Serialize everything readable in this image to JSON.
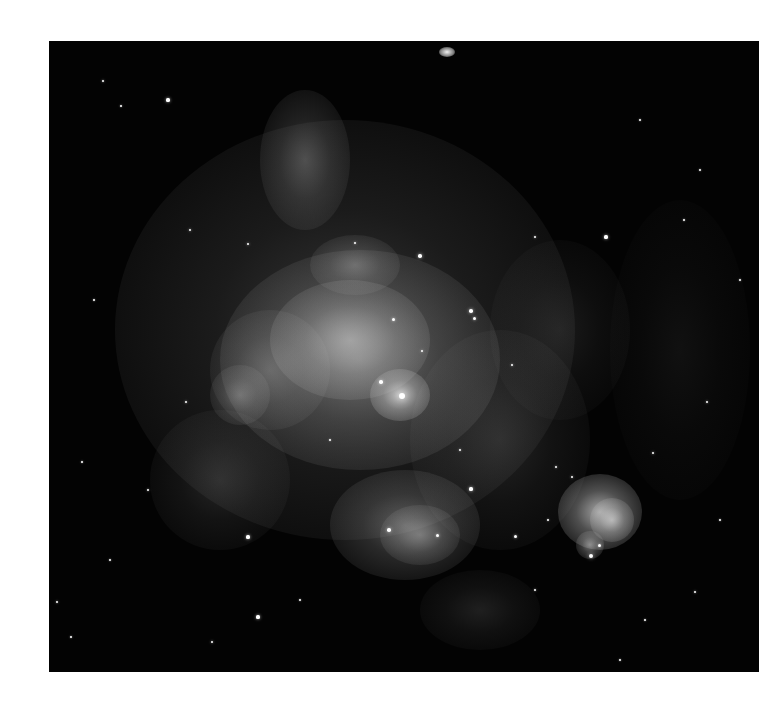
{
  "image": {
    "alt": "Grayscale astronomical image of a large emission nebula with filamentary gas and scattered stars",
    "background": "#030303",
    "page_background": "#ffffff"
  },
  "nebula": [
    {
      "x": 345,
      "y": 330,
      "rx": 230,
      "ry": 210,
      "a": 0.22
    },
    {
      "x": 360,
      "y": 360,
      "rx": 140,
      "ry": 110,
      "a": 0.35
    },
    {
      "x": 350,
      "y": 340,
      "rx": 80,
      "ry": 60,
      "a": 0.45
    },
    {
      "x": 400,
      "y": 395,
      "rx": 30,
      "ry": 26,
      "a": 0.75
    },
    {
      "x": 270,
      "y": 370,
      "rx": 60,
      "ry": 60,
      "a": 0.25
    },
    {
      "x": 240,
      "y": 395,
      "rx": 30,
      "ry": 30,
      "a": 0.3
    },
    {
      "x": 305,
      "y": 160,
      "rx": 45,
      "ry": 70,
      "a": 0.28
    },
    {
      "x": 355,
      "y": 265,
      "rx": 45,
      "ry": 30,
      "a": 0.3
    },
    {
      "x": 405,
      "y": 525,
      "rx": 75,
      "ry": 55,
      "a": 0.35
    },
    {
      "x": 420,
      "y": 535,
      "rx": 40,
      "ry": 30,
      "a": 0.35
    },
    {
      "x": 600,
      "y": 512,
      "rx": 42,
      "ry": 38,
      "a": 0.7
    },
    {
      "x": 612,
      "y": 520,
      "rx": 22,
      "ry": 22,
      "a": 0.6
    },
    {
      "x": 590,
      "y": 545,
      "rx": 14,
      "ry": 14,
      "a": 0.5
    },
    {
      "x": 220,
      "y": 480,
      "rx": 70,
      "ry": 70,
      "a": 0.15
    },
    {
      "x": 500,
      "y": 440,
      "rx": 90,
      "ry": 110,
      "a": 0.14
    },
    {
      "x": 560,
      "y": 330,
      "rx": 70,
      "ry": 90,
      "a": 0.1
    },
    {
      "x": 680,
      "y": 350,
      "rx": 70,
      "ry": 150,
      "a": 0.06
    },
    {
      "x": 480,
      "y": 610,
      "rx": 60,
      "ry": 40,
      "a": 0.12
    }
  ],
  "galaxy": {
    "x": 447,
    "y": 52,
    "rx": 8,
    "ry": 5,
    "a": 0.95
  },
  "stars": [
    {
      "x": 103,
      "y": 81,
      "r": 1.2
    },
    {
      "x": 121,
      "y": 106,
      "r": 1.0
    },
    {
      "x": 168,
      "y": 100,
      "r": 1.6
    },
    {
      "x": 402,
      "y": 396,
      "r": 3.0
    },
    {
      "x": 381,
      "y": 382,
      "r": 1.8
    },
    {
      "x": 393,
      "y": 319,
      "r": 1.5
    },
    {
      "x": 471,
      "y": 311,
      "r": 1.8
    },
    {
      "x": 474,
      "y": 318,
      "r": 1.5
    },
    {
      "x": 422,
      "y": 351,
      "r": 1.4
    },
    {
      "x": 248,
      "y": 244,
      "r": 1.4
    },
    {
      "x": 355,
      "y": 243,
      "r": 1.2
    },
    {
      "x": 420,
      "y": 256,
      "r": 1.8
    },
    {
      "x": 606,
      "y": 237,
      "r": 1.6
    },
    {
      "x": 591,
      "y": 556,
      "r": 2.2
    },
    {
      "x": 599,
      "y": 545,
      "r": 1.5
    },
    {
      "x": 556,
      "y": 467,
      "r": 1.3
    },
    {
      "x": 572,
      "y": 477,
      "r": 1.4
    },
    {
      "x": 653,
      "y": 453,
      "r": 1.4
    },
    {
      "x": 389,
      "y": 530,
      "r": 1.8
    },
    {
      "x": 437,
      "y": 535,
      "r": 1.5
    },
    {
      "x": 471,
      "y": 489,
      "r": 1.6
    },
    {
      "x": 186,
      "y": 402,
      "r": 1.2
    },
    {
      "x": 148,
      "y": 490,
      "r": 1.2
    },
    {
      "x": 248,
      "y": 537,
      "r": 1.6
    },
    {
      "x": 258,
      "y": 617,
      "r": 1.6
    },
    {
      "x": 212,
      "y": 642,
      "r": 1.4
    },
    {
      "x": 535,
      "y": 590,
      "r": 1.2
    },
    {
      "x": 707,
      "y": 402,
      "r": 1.3
    },
    {
      "x": 695,
      "y": 592,
      "r": 1.2
    },
    {
      "x": 645,
      "y": 620,
      "r": 1.0
    },
    {
      "x": 71,
      "y": 637,
      "r": 1.0
    },
    {
      "x": 57,
      "y": 602,
      "r": 1.2
    },
    {
      "x": 82,
      "y": 462,
      "r": 1.0
    },
    {
      "x": 535,
      "y": 237,
      "r": 1.2
    },
    {
      "x": 640,
      "y": 120,
      "r": 1.0
    },
    {
      "x": 700,
      "y": 170,
      "r": 1.0
    },
    {
      "x": 190,
      "y": 230,
      "r": 1.4
    },
    {
      "x": 94,
      "y": 300,
      "r": 1.0
    },
    {
      "x": 512,
      "y": 365,
      "r": 1.3
    },
    {
      "x": 460,
      "y": 450,
      "r": 1.2
    },
    {
      "x": 330,
      "y": 440,
      "r": 1.0
    },
    {
      "x": 548,
      "y": 520,
      "r": 1.0
    },
    {
      "x": 684,
      "y": 220,
      "r": 1.0
    },
    {
      "x": 740,
      "y": 280,
      "r": 1.0
    },
    {
      "x": 720,
      "y": 520,
      "r": 1.0
    },
    {
      "x": 110,
      "y": 560,
      "r": 1.0
    },
    {
      "x": 300,
      "y": 600,
      "r": 1.0
    },
    {
      "x": 620,
      "y": 660,
      "r": 1.0
    },
    {
      "x": 515,
      "y": 536,
      "r": 1.5
    }
  ]
}
